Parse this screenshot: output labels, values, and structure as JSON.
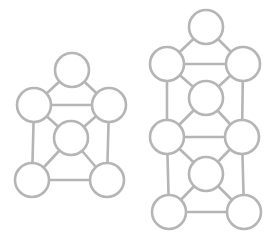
{
  "diagram": {
    "type": "graph",
    "background": "#ffffff",
    "stroke_color": "#b5b5b5",
    "stroke_width": 2.6,
    "node_radius": 17,
    "graphs": [
      {
        "id": "left-graph",
        "nodes": [
          {
            "id": "L-top",
            "x": 72,
            "y": 70
          },
          {
            "id": "L-mid-left",
            "x": 34,
            "y": 105
          },
          {
            "id": "L-mid-right",
            "x": 109,
            "y": 105
          },
          {
            "id": "L-center",
            "x": 71,
            "y": 138
          },
          {
            "id": "L-bottom-left",
            "x": 32,
            "y": 180
          },
          {
            "id": "L-bottom-right",
            "x": 107,
            "y": 180
          }
        ],
        "edges": [
          [
            "L-top",
            "L-mid-left"
          ],
          [
            "L-top",
            "L-mid-right"
          ],
          [
            "L-mid-left",
            "L-mid-right"
          ],
          [
            "L-mid-left",
            "L-center"
          ],
          [
            "L-mid-right",
            "L-center"
          ],
          [
            "L-mid-left",
            "L-bottom-left"
          ],
          [
            "L-mid-right",
            "L-bottom-right"
          ],
          [
            "L-center",
            "L-bottom-left"
          ],
          [
            "L-center",
            "L-bottom-right"
          ],
          [
            "L-bottom-left",
            "L-bottom-right"
          ]
        ]
      },
      {
        "id": "right-graph",
        "nodes": [
          {
            "id": "R-top",
            "x": 206,
            "y": 27
          },
          {
            "id": "R-row1-left",
            "x": 167,
            "y": 64
          },
          {
            "id": "R-row1-right",
            "x": 243,
            "y": 64
          },
          {
            "id": "R-center1",
            "x": 206,
            "y": 98
          },
          {
            "id": "R-row2-left",
            "x": 167,
            "y": 137
          },
          {
            "id": "R-row2-right",
            "x": 242,
            "y": 137
          },
          {
            "id": "R-center2",
            "x": 206,
            "y": 174
          },
          {
            "id": "R-row3-left",
            "x": 169,
            "y": 212
          },
          {
            "id": "R-row3-right",
            "x": 244,
            "y": 212
          }
        ],
        "edges": [
          [
            "R-top",
            "R-row1-left"
          ],
          [
            "R-top",
            "R-row1-right"
          ],
          [
            "R-row1-left",
            "R-row1-right"
          ],
          [
            "R-row1-left",
            "R-center1"
          ],
          [
            "R-row1-right",
            "R-center1"
          ],
          [
            "R-row1-left",
            "R-row2-left"
          ],
          [
            "R-row1-right",
            "R-row2-right"
          ],
          [
            "R-center1",
            "R-row2-left"
          ],
          [
            "R-center1",
            "R-row2-right"
          ],
          [
            "R-row2-left",
            "R-row2-right"
          ],
          [
            "R-row2-left",
            "R-center2"
          ],
          [
            "R-row2-right",
            "R-center2"
          ],
          [
            "R-row2-left",
            "R-row3-left"
          ],
          [
            "R-row2-right",
            "R-row3-right"
          ],
          [
            "R-center2",
            "R-row3-left"
          ],
          [
            "R-center2",
            "R-row3-right"
          ],
          [
            "R-row3-left",
            "R-row3-right"
          ]
        ]
      }
    ]
  }
}
